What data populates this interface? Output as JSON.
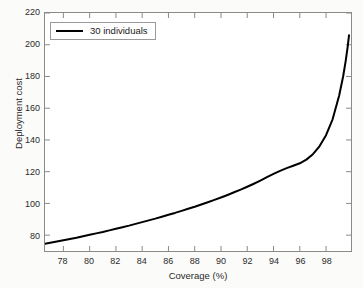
{
  "chart_data": {
    "type": "line",
    "title": "",
    "xlabel": "Coverage (%)",
    "ylabel": "Deployment cost",
    "xlim": [
      76.6,
      99.9
    ],
    "ylim": [
      70,
      220
    ],
    "xticks": [
      78,
      80,
      82,
      84,
      86,
      88,
      90,
      92,
      94,
      96,
      98
    ],
    "yticks": [
      80,
      100,
      120,
      140,
      160,
      180,
      200,
      220
    ],
    "grid": false,
    "legend_position": "top-left",
    "series": [
      {
        "name": "30 individuals",
        "color": "#000000",
        "x": [
          76.6,
          77.0,
          77.5,
          78.0,
          78.5,
          79.0,
          79.5,
          80.0,
          80.5,
          81.0,
          81.5,
          82.0,
          82.5,
          83.0,
          83.5,
          84.0,
          84.5,
          85.0,
          85.5,
          86.0,
          86.5,
          87.0,
          87.5,
          88.0,
          88.5,
          89.0,
          89.5,
          90.0,
          90.5,
          91.0,
          91.5,
          92.0,
          92.5,
          93.0,
          93.5,
          94.0,
          94.5,
          95.0,
          95.5,
          96.0,
          96.5,
          97.0,
          97.5,
          98.0,
          98.5,
          99.0,
          99.3,
          99.5,
          99.65,
          99.75
        ],
        "y": [
          74.6,
          75.2,
          76.0,
          76.8,
          77.6,
          78.4,
          79.3,
          80.2,
          81.1,
          82.0,
          83.0,
          84.0,
          85.0,
          86.0,
          87.1,
          88.2,
          89.3,
          90.4,
          91.6,
          92.8,
          94.0,
          95.3,
          96.6,
          97.9,
          99.3,
          100.7,
          102.2,
          103.7,
          105.3,
          107.0,
          108.7,
          110.5,
          112.4,
          114.4,
          116.5,
          118.6,
          120.5,
          122.2,
          123.7,
          125.3,
          127.6,
          131.0,
          136.0,
          143.0,
          153.0,
          168.0,
          180.0,
          190.0,
          199.0,
          206.0
        ]
      }
    ]
  },
  "legend": {
    "entries": [
      {
        "label": "30 individuals"
      }
    ]
  }
}
